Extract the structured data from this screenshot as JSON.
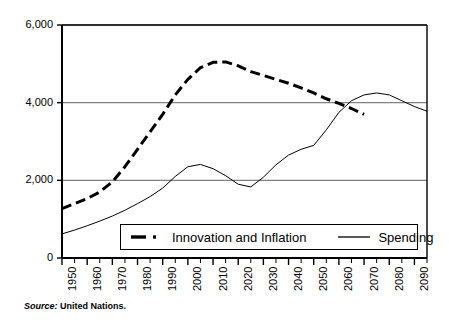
{
  "chart_data": {
    "type": "line",
    "title": "",
    "subtitle": "",
    "xlabel": "",
    "ylabel": "",
    "xlim": [
      1950,
      2095
    ],
    "ylim": [
      0,
      6000
    ],
    "ytick_labels": [
      "6,000",
      "4,000",
      "2,000",
      "0"
    ],
    "ytick_values": [
      6000,
      4000,
      2000,
      0
    ],
    "xtick_labels": [
      "1950",
      "1960",
      "1970",
      "1980",
      "1990",
      "2000",
      "2010",
      "2020",
      "2030",
      "2040",
      "2050",
      "2060",
      "2070",
      "2080",
      "2090"
    ],
    "xtick_values": [
      1950,
      1960,
      1970,
      1980,
      1990,
      2000,
      2010,
      2020,
      2030,
      2040,
      2050,
      2060,
      2070,
      2080,
      2090
    ],
    "minor_tick_step": 5,
    "grid": "horizontal-major",
    "legend_position": "inside-bottom-center",
    "x": [
      1950,
      1955,
      1960,
      1965,
      1970,
      1975,
      1980,
      1985,
      1990,
      1995,
      2000,
      2005,
      2010,
      2015,
      2020,
      2025,
      2030,
      2035,
      2040,
      2045,
      2050,
      2055,
      2060,
      2065,
      2070,
      2075,
      2080,
      2085,
      2090,
      2095
    ],
    "series": [
      {
        "name": "Innovation and Inflation",
        "style": "dashed",
        "width": 3,
        "color": "#000000",
        "x": [
          1950,
          1955,
          1960,
          1965,
          1970,
          1975,
          1980,
          1985,
          1990,
          1995,
          2000,
          2005,
          2010,
          2015,
          2020,
          2025,
          2030,
          2035,
          2040,
          2045,
          2050,
          2055,
          2060,
          2065,
          2070
        ],
        "values": [
          1270,
          1400,
          1530,
          1700,
          1960,
          2350,
          2800,
          3250,
          3700,
          4200,
          4600,
          4900,
          5040,
          5050,
          4950,
          4800,
          4700,
          4600,
          4500,
          4380,
          4250,
          4100,
          3980,
          3850,
          3700
        ]
      },
      {
        "name": "Spending",
        "style": "solid",
        "width": 1,
        "color": "#000000",
        "x": [
          1950,
          1955,
          1960,
          1965,
          1970,
          1975,
          1980,
          1985,
          1990,
          1995,
          2000,
          2005,
          2010,
          2015,
          2020,
          2025,
          2030,
          2035,
          2040,
          2045,
          2050,
          2055,
          2060,
          2065,
          2070,
          2075,
          2080,
          2085,
          2090,
          2095
        ],
        "values": [
          620,
          720,
          830,
          950,
          1080,
          1230,
          1400,
          1580,
          1800,
          2100,
          2350,
          2410,
          2300,
          2120,
          1900,
          1830,
          2080,
          2400,
          2650,
          2800,
          2900,
          3300,
          3750,
          4050,
          4200,
          4250,
          4200,
          4050,
          3900,
          3780
        ]
      }
    ]
  },
  "legend": {
    "entries": [
      {
        "label": "Innovation and Inflation",
        "style": "dash-dot",
        "swatch_name": "legend-swatch-dashed"
      },
      {
        "label": "Spending",
        "style": "solid",
        "swatch_name": "legend-swatch-solid"
      }
    ]
  },
  "footnote": {
    "source_word": "Source:",
    "source_text": " United Nations."
  },
  "colors": {
    "axis": "#000000",
    "grid": "#808080",
    "series_primary": "#000000",
    "series_secondary": "#000000",
    "background": "#ffffff"
  }
}
